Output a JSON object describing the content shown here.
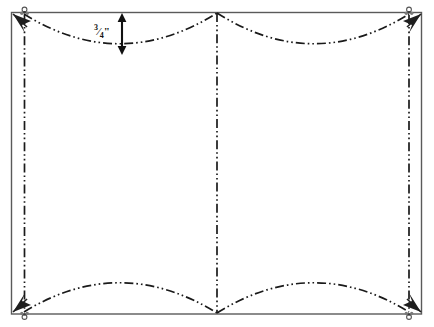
{
  "figure": {
    "background_color": "#ffffff",
    "ink_color": "#1a1a1a",
    "border_color": "#555555",
    "width": 434,
    "height": 327
  },
  "outline": {
    "name": "fabric-rectangle",
    "left": 11,
    "top": 12,
    "right": 422,
    "bottom": 314,
    "stroke_color": "#555555",
    "stroke_width": 1.4
  },
  "seam_lines": {
    "left_vertical": {
      "x": 24,
      "top": 16,
      "bottom": 310
    },
    "right_vertical": {
      "x": 409,
      "top": 16,
      "bottom": 310
    },
    "center_vertical": {
      "x": 217,
      "top": 13,
      "bottom": 313
    }
  },
  "arcs": {
    "top_left": {
      "start_x": 24,
      "start_y": 14,
      "end_x": 217,
      "end_y": 13,
      "apex_x": 120,
      "apex_y": 53,
      "direction": "concave-down"
    },
    "top_right": {
      "start_x": 217,
      "start_y": 13,
      "end_x": 409,
      "end_y": 14,
      "apex_x": 313,
      "apex_y": 53,
      "direction": "concave-down"
    },
    "bottom_left": {
      "start_x": 24,
      "start_y": 312,
      "end_x": 217,
      "end_y": 313,
      "apex_x": 120,
      "apex_y": 274,
      "direction": "convex-up"
    },
    "bottom_right": {
      "start_x": 217,
      "start_y": 313,
      "end_x": 409,
      "end_y": 312,
      "apex_x": 313,
      "apex_y": 274,
      "direction": "convex-up"
    }
  },
  "corner_markers": [
    {
      "name": "corner-marker-top-left",
      "x": 24,
      "y": 12,
      "arrow_dx": -13,
      "arrow_dy": 13
    },
    {
      "name": "corner-marker-top-right",
      "x": 409,
      "y": 12,
      "arrow_dx": 13,
      "arrow_dy": 13
    },
    {
      "name": "corner-marker-bottom-left",
      "x": 24,
      "y": 314,
      "arrow_dx": -13,
      "arrow_dy": -13
    },
    {
      "name": "corner-marker-bottom-right",
      "x": 409,
      "y": 314,
      "arrow_dx": 13,
      "arrow_dy": -13
    }
  ],
  "dimension": {
    "name": "depth-dimension",
    "label_whole": "",
    "label_numerator": "3",
    "label_denominator": "4",
    "label_unit": "\"",
    "label_full": "3/4\"",
    "arrow_x": 122,
    "arrow_top_y": 14,
    "arrow_bottom_y": 54,
    "label_x": 96,
    "label_y": 26
  },
  "line_style": {
    "name": "dash-dot-dot",
    "dash_array": "9,3,1.6,3,1.6,3",
    "stroke_width": 1.6
  }
}
